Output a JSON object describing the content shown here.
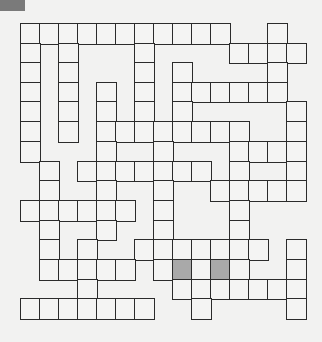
{
  "puzzle": {
    "type": "crossword-grid",
    "cols": 15,
    "rows": 15,
    "origin_x": 21,
    "origin_y": 24,
    "cell_w": 19,
    "row_edges": [
      24,
      44,
      63,
      83,
      102,
      122,
      142,
      162,
      181,
      201,
      221,
      240,
      260,
      280,
      299,
      319
    ],
    "cells_by_row": [
      [
        0,
        1,
        2,
        3,
        4,
        5,
        6,
        7,
        8,
        9,
        10,
        13
      ],
      [
        0,
        2,
        6,
        11,
        12,
        13,
        14
      ],
      [
        0,
        2,
        6,
        8,
        13
      ],
      [
        0,
        2,
        4,
        6,
        8,
        9,
        10,
        11,
        12,
        13
      ],
      [
        0,
        2,
        4,
        6,
        8,
        14
      ],
      [
        0,
        2,
        4,
        5,
        6,
        7,
        8,
        9,
        10,
        11,
        14
      ],
      [
        0,
        4,
        7,
        11,
        12,
        13,
        14
      ],
      [
        1,
        3,
        4,
        5,
        6,
        7,
        8,
        9,
        11,
        14
      ],
      [
        1,
        4,
        7,
        10,
        11,
        12,
        13,
        14
      ],
      [
        0,
        1,
        2,
        3,
        4,
        5,
        7,
        11
      ],
      [
        1,
        4,
        7,
        11
      ],
      [
        1,
        3,
        6,
        7,
        8,
        9,
        10,
        11,
        12,
        14
      ],
      [
        1,
        2,
        3,
        4,
        5,
        7,
        8,
        9,
        10,
        11,
        14
      ],
      [
        3,
        8,
        9,
        10,
        11,
        12,
        13,
        14
      ],
      [
        0,
        1,
        2,
        3,
        4,
        5,
        6,
        9,
        14
      ]
    ],
    "shaded_cells": [
      [
        12,
        8
      ],
      [
        12,
        10
      ]
    ],
    "colors": {
      "line": "#2b2b2b",
      "cell": "#f4f4f3",
      "shaded": "#a9a9a9",
      "background": "#f2f2f1",
      "corner_marker": "#7a7a7a"
    }
  }
}
